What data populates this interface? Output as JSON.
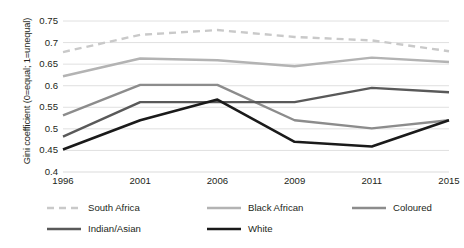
{
  "chart_data": {
    "type": "line",
    "title": "",
    "xlabel": "",
    "ylabel": "Gini coefficient (0=equal; 1=unequal)",
    "categories": [
      "1996",
      "2001",
      "2006",
      "2009",
      "2011",
      "2015"
    ],
    "ylim": [
      0.4,
      0.75
    ],
    "ytick_labels": [
      "0.75",
      "0.7",
      "0.65",
      "0.6",
      "0.55",
      "0.5",
      "0.45",
      "0.4"
    ],
    "ytick_values": [
      0.75,
      0.7,
      0.65,
      0.6,
      0.55,
      0.5,
      0.45,
      0.4
    ],
    "grid": "horizontal",
    "legend_position": "bottom",
    "series": [
      {
        "name": "South Africa",
        "values": [
          0.678,
          0.718,
          0.729,
          0.713,
          0.705,
          0.68
        ],
        "color": "#c9c9c9",
        "dash": "7,5",
        "width": 2.4
      },
      {
        "name": "Black African",
        "values": [
          0.622,
          0.663,
          0.659,
          0.645,
          0.665,
          0.655
        ],
        "color": "#b3b3b3",
        "dash": "none",
        "width": 2.4
      },
      {
        "name": "Coloured",
        "values": [
          0.531,
          0.602,
          0.602,
          0.52,
          0.501,
          0.52
        ],
        "color": "#8c8c8c",
        "dash": "none",
        "width": 2.4
      },
      {
        "name": "Indian/Asian",
        "values": [
          0.482,
          0.562,
          0.562,
          0.562,
          0.595,
          0.585
        ],
        "color": "#595959",
        "dash": "none",
        "width": 2.4
      },
      {
        "name": "White",
        "values": [
          0.452,
          0.52,
          0.568,
          0.47,
          0.459,
          0.52
        ],
        "color": "#1a1a1a",
        "dash": "none",
        "width": 2.6
      }
    ]
  },
  "axis": {
    "y_title": "Gini coefficient (0=equal; 1=unequal)"
  },
  "legend": {
    "items": [
      {
        "label": "South Africa"
      },
      {
        "label": "Black African"
      },
      {
        "label": "Coloured"
      },
      {
        "label": "Indian/Asian"
      },
      {
        "label": "White"
      }
    ]
  },
  "colors": {
    "grid": "#dcdcdc",
    "axis": "#bfbfbf",
    "text": "#231f20",
    "background": "#ffffff"
  }
}
